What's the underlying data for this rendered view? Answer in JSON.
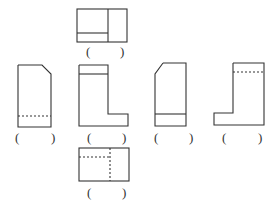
{
  "diagram": {
    "type": "orthographic-views",
    "stroke_color": "#333333",
    "views": [
      {
        "id": "top",
        "label": "( )",
        "open": "(",
        "close": ")"
      },
      {
        "id": "left-1",
        "label": "( )",
        "open": "(",
        "close": ")"
      },
      {
        "id": "front",
        "label": "( )",
        "open": "(",
        "close": ")"
      },
      {
        "id": "right-1",
        "label": "( )",
        "open": "(",
        "close": ")"
      },
      {
        "id": "rear",
        "label": "( )",
        "open": "(",
        "close": ")"
      },
      {
        "id": "bottom",
        "label": "( )",
        "open": "(",
        "close": ")"
      }
    ]
  }
}
